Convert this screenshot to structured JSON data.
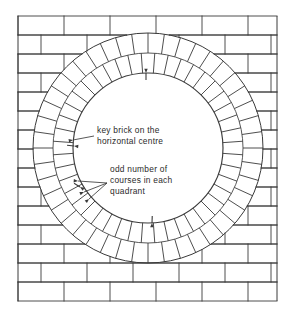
{
  "figure": {
    "background_color": "#ffffff",
    "line_color": "#3a3a3a",
    "text_color": "#2b2b2b",
    "mortar_color": "#9a9a9a"
  },
  "wall": {
    "name": "stretcher-bond-brick-wall",
    "bond": "stretcher bond",
    "left": 18,
    "top": 16,
    "right": 277,
    "bottom": 301,
    "course_height": 19,
    "course_count": 15,
    "brick_length": 46,
    "offset": 23
  },
  "arch": {
    "name": "circular-arch-opening",
    "center_x": 148,
    "center_y": 148,
    "inner_radius": 75,
    "mid_radius": 95,
    "outer_radius": 115,
    "ring_courses": 2,
    "voussoirs_per_ring": 44,
    "voussoirs_per_quadrant": 11,
    "key_brick_angle_deg": 180
  },
  "annotations": [
    {
      "id": "key-brick",
      "lines": [
        "key brick on the",
        "horizontal centre"
      ],
      "text_x": 97,
      "text_y": 133,
      "leaders": [
        {
          "from_x": 94,
          "from_y": 136,
          "to_x": 73,
          "to_y": 140
        }
      ]
    },
    {
      "id": "odd-courses",
      "lines": [
        "odd number of",
        "courses in each",
        "quadrant"
      ],
      "text_x": 110,
      "text_y": 172,
      "leaders": [
        {
          "from_x": 107,
          "from_y": 183,
          "to_x": 78,
          "to_y": 181
        },
        {
          "from_x": 107,
          "from_y": 183,
          "to_x": 84,
          "to_y": 192
        },
        {
          "from_x": 107,
          "from_y": 183,
          "to_x": 89,
          "to_y": 199
        }
      ]
    }
  ],
  "tick_marks": [
    {
      "id": "tick-upper-left",
      "x": 74,
      "y": 146,
      "angle_deg": 186
    },
    {
      "id": "tick-lower-left",
      "x": 80,
      "y": 187,
      "angle_deg": 212
    },
    {
      "id": "tick-lower-right",
      "x": 152,
      "y": 223,
      "angle_deg": 272
    },
    {
      "id": "tick-top-centre",
      "x": 146,
      "y": 73,
      "angle_deg": 90
    }
  ]
}
